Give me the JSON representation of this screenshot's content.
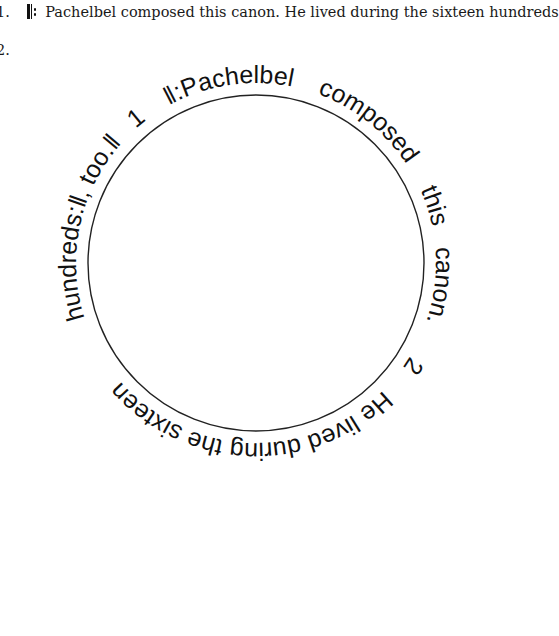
{
  "items": [
    {
      "number": "1.",
      "repeat_start_icon": "repeat-start-icon",
      "text": "Pachelbel composed this canon. He lived during the sixteen hundreds"
    },
    {
      "number": "2."
    }
  ],
  "round": {
    "circle": {
      "cx": 256,
      "cy": 263,
      "r": 168,
      "stroke": "#222222"
    },
    "text_radius": 180,
    "segments": [
      {
        "text": "‖:Pachelbel",
        "start_angle": 331
      },
      {
        "text": "composed",
        "start_angle": 20
      },
      {
        "text": "this",
        "start_angle": 66
      },
      {
        "text": "canon.",
        "start_angle": 85
      },
      {
        "text": "2",
        "start_angle": 121
      },
      {
        "text": "He lived during the sixteen",
        "start_angle": 135
      },
      {
        "text": "hundreds:‖,",
        "start_angle": 252
      },
      {
        "text": "too.‖",
        "start_angle": 295
      },
      {
        "text": "1",
        "start_angle": 318
      }
    ]
  }
}
